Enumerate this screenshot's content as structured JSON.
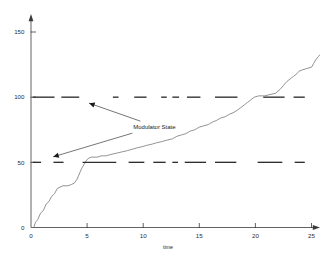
{
  "chart_data": {
    "type": "line",
    "title": "",
    "xlabel": "time",
    "ylabel": "",
    "xlim": [
      0,
      26.5
    ],
    "ylim": [
      0,
      160
    ],
    "grid": false,
    "legend_position": "none",
    "xticks": [
      0,
      5,
      10,
      15,
      20,
      25
    ],
    "xtick_labels": [
      "0",
      "5",
      "10",
      "15",
      "20",
      "25"
    ],
    "yticks": [
      0,
      50,
      100,
      150
    ],
    "ytick_labels": [
      "0",
      "50",
      "100",
      "150"
    ],
    "annotations": [
      {
        "text": "Modulator State",
        "x": 11.0,
        "y": 77,
        "points_to": [
          [
            5.0,
            100
          ],
          [
            1.8,
            50
          ]
        ]
      }
    ],
    "series": [
      {
        "name": "accumulated output",
        "type": "staircase-line",
        "color": "#6f6f6f",
        "points": [
          [
            0.0,
            0
          ],
          [
            0.25,
            0
          ],
          [
            0.4,
            4
          ],
          [
            0.6,
            6
          ],
          [
            0.85,
            11
          ],
          [
            1.1,
            13
          ],
          [
            1.35,
            18
          ],
          [
            1.6,
            20
          ],
          [
            1.85,
            24
          ],
          [
            2.1,
            26
          ],
          [
            2.35,
            30
          ],
          [
            2.6,
            31
          ],
          [
            2.85,
            32
          ],
          [
            3.3,
            32
          ],
          [
            3.6,
            33
          ],
          [
            3.85,
            34
          ],
          [
            4.1,
            37
          ],
          [
            4.3,
            41
          ],
          [
            4.5,
            45
          ],
          [
            4.7,
            48
          ],
          [
            4.9,
            51
          ],
          [
            5.1,
            53
          ],
          [
            5.4,
            54
          ],
          [
            5.9,
            54
          ],
          [
            6.3,
            55
          ],
          [
            6.7,
            55
          ],
          [
            7.1,
            56
          ],
          [
            7.6,
            57
          ],
          [
            8.1,
            58
          ],
          [
            8.6,
            59
          ],
          [
            9.0,
            60
          ],
          [
            9.4,
            61
          ],
          [
            9.9,
            62
          ],
          [
            10.3,
            63
          ],
          [
            10.8,
            64
          ],
          [
            11.2,
            65
          ],
          [
            11.7,
            66
          ],
          [
            12.1,
            67
          ],
          [
            12.6,
            68
          ],
          [
            13.0,
            70
          ],
          [
            13.4,
            71
          ],
          [
            13.8,
            72
          ],
          [
            14.2,
            74
          ],
          [
            14.6,
            75
          ],
          [
            15.0,
            77
          ],
          [
            15.4,
            78
          ],
          [
            15.8,
            79
          ],
          [
            16.2,
            81
          ],
          [
            16.5,
            82
          ],
          [
            16.9,
            84
          ],
          [
            17.3,
            85
          ],
          [
            17.7,
            87
          ],
          [
            18.0,
            88
          ],
          [
            18.4,
            90
          ],
          [
            18.7,
            92
          ],
          [
            19.0,
            94
          ],
          [
            19.3,
            96
          ],
          [
            19.6,
            98
          ],
          [
            19.9,
            100
          ],
          [
            20.3,
            101
          ],
          [
            20.8,
            101
          ],
          [
            21.3,
            102
          ],
          [
            21.8,
            103
          ],
          [
            22.2,
            106
          ],
          [
            22.5,
            109
          ],
          [
            22.8,
            112
          ],
          [
            23.1,
            114
          ],
          [
            23.4,
            116
          ],
          [
            23.7,
            118
          ],
          [
            23.9,
            120
          ],
          [
            24.2,
            121
          ],
          [
            24.6,
            122
          ],
          [
            25.0,
            123
          ],
          [
            25.2,
            126
          ],
          [
            25.4,
            129
          ],
          [
            25.6,
            131
          ],
          [
            25.8,
            133
          ]
        ]
      },
      {
        "name": "Modulator State (high level)",
        "type": "dashed-level",
        "level": 100,
        "color": "#2e2e2e",
        "segments": [
          [
            0.15,
            2.1
          ],
          [
            2.7,
            4.3
          ],
          [
            7.3,
            7.8
          ],
          [
            9.2,
            10.3
          ],
          [
            11.6,
            12.1
          ],
          [
            12.6,
            13.2
          ],
          [
            13.9,
            15.1
          ],
          [
            16.4,
            18.4
          ],
          [
            20.7,
            22.6
          ],
          [
            23.4,
            24.4
          ]
        ]
      },
      {
        "name": "Modulator State (low level)",
        "type": "dashed-level",
        "level": 50,
        "color": "#2e2e2e",
        "segments": [
          [
            0.15,
            0.9
          ],
          [
            2.0,
            2.9
          ],
          [
            4.6,
            7.6
          ],
          [
            8.7,
            10.1
          ],
          [
            10.9,
            12.0
          ],
          [
            12.6,
            13.1
          ],
          [
            13.7,
            15.6
          ],
          [
            16.4,
            18.3
          ],
          [
            20.2,
            22.4
          ],
          [
            23.5,
            24.4
          ]
        ]
      }
    ]
  }
}
